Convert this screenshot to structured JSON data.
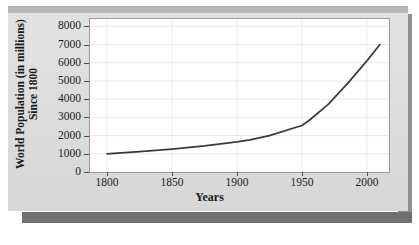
{
  "chart_data": {
    "type": "line",
    "title": "",
    "xlabel": "Years",
    "ylabel": "World Population (in millions) Since 1800",
    "ylabel_line1": "World Population (in millions)",
    "ylabel_line2": "Since 1800",
    "xlim": [
      1787,
      2017
    ],
    "ylim": [
      0,
      8400
    ],
    "x_ticks": [
      1800,
      1850,
      1900,
      1950,
      2000
    ],
    "x_tick_labels": [
      "1800",
      "1850",
      "1900",
      "1950",
      "2000"
    ],
    "y_ticks": [
      0,
      1000,
      2000,
      3000,
      4000,
      5000,
      6000,
      7000,
      8000
    ],
    "y_tick_labels": [
      "0",
      "1000",
      "2000",
      "3000",
      "4000",
      "5000",
      "6000",
      "7000",
      "8000"
    ],
    "grid": true,
    "legend": null,
    "series": [
      {
        "name": "World Population",
        "x": [
          1800,
          1825,
          1850,
          1875,
          1900,
          1910,
          1925,
          1950,
          1955,
          1970,
          1985,
          2000,
          2010
        ],
        "values": [
          1000,
          1120,
          1260,
          1430,
          1650,
          1760,
          2000,
          2550,
          2800,
          3700,
          4850,
          6100,
          7000
        ],
        "color": "#3a3a3a"
      }
    ]
  },
  "figure": {
    "panel_color": "#dedede",
    "plot_background": "#ffffff",
    "axis_color": "#4a4a4a",
    "line_color": "#3a3a3a",
    "shadow_color": "#6f6f6f"
  }
}
